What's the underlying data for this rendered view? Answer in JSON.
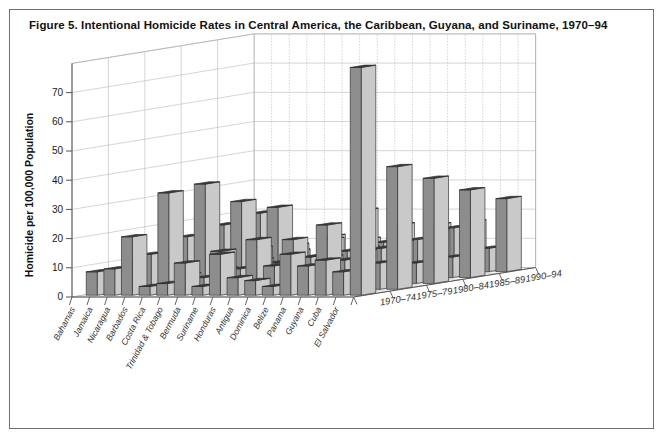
{
  "figure": {
    "title": "Figure 5. Intentional Homicide Rates in Central America, the Caribbean, Guyana, and Suriname, 1970–94",
    "border_color": "#6f6f6f",
    "background": "#ffffff"
  },
  "axes": {
    "y_label": "Homicide per 100,000 Population",
    "y_ticks": [
      "0",
      "10",
      "20",
      "30",
      "40",
      "50",
      "60",
      "70"
    ]
  },
  "colors": {
    "bar_front": "#8d8d8d",
    "bar_side": "#c9c9c9",
    "bar_top": "#3c3c3c",
    "bar_edge": "#2b2b2b",
    "grid": "#b4b4b4",
    "floor": "#ffffff",
    "axis": "#555555"
  },
  "chart_data": {
    "type": "bar",
    "title": "Figure 5. Intentional Homicide Rates in Central America, the Caribbean, Guyana, and Suriname, 1970–94",
    "xlabel": "",
    "ylabel": "Homicide per 100,000 Population",
    "zlabel": "",
    "ylim": [
      0,
      80
    ],
    "ygrid": true,
    "legend": "none",
    "projection": "3d",
    "categories": [
      "Bahamas",
      "Jamaica",
      "Nicaragua",
      "Barbados",
      "Costa Rica",
      "Trinidad & Tobago",
      "Bermuda",
      "Suriname",
      "Honduras",
      "Antigua",
      "Dominica",
      "Belize",
      "Panama",
      "Guyana",
      "Cuba",
      "El Salvador"
    ],
    "periods": [
      "1970–74",
      "1975–79",
      "1980–84",
      "1985–89",
      "1990–94"
    ],
    "series": [
      {
        "name": "1970–74",
        "values": [
          8,
          9,
          20,
          3,
          4,
          11,
          3,
          14,
          6,
          5,
          3,
          14,
          10,
          12,
          8,
          78
        ]
      },
      {
        "name": "1975–79",
        "values": [
          9,
          12,
          33,
          5,
          4,
          13,
          2,
          17,
          8,
          6,
          4,
          22,
          10,
          13,
          9,
          42
        ]
      },
      {
        "name": "1980–84",
        "values": [
          11,
          16,
          34,
          5,
          5,
          12,
          2,
          15,
          9,
          9,
          4,
          25,
          12,
          14,
          7,
          36
        ]
      },
      {
        "name": "1985–89",
        "values": [
          12,
          18,
          26,
          6,
          5,
          11,
          2,
          13,
          9,
          10,
          5,
          18,
          13,
          16,
          7,
          30
        ]
      },
      {
        "name": "1990–94",
        "values": [
          13,
          20,
          22,
          7,
          5,
          12,
          2,
          11,
          10,
          9,
          5,
          16,
          15,
          17,
          8,
          25
        ]
      }
    ]
  }
}
